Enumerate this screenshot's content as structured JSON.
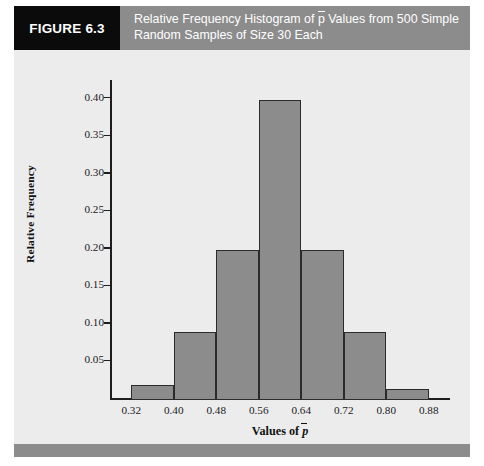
{
  "figure": {
    "tag": "FIGURE 6.3",
    "caption_line1_pre": "Relative Frequency Histogram of ",
    "caption_pbar": "p",
    "caption_line1_post": " Values from 500 Simple",
    "caption_line2": "Random Samples of Size 30 Each",
    "header_bg": "#8c8c8c",
    "tag_bg": "#0b0b0b",
    "panel_bg": "#ececed"
  },
  "chart_data": {
    "type": "bar",
    "xlabel": "Values of p̄",
    "ylabel": "Relative Frequency",
    "grid": false,
    "legend": "none",
    "bar_color": "#8c8c8c",
    "bar_edge_color": "#2b2b2b",
    "xlim": [
      0.28,
      0.92
    ],
    "ylim": [
      0.0,
      0.425
    ],
    "xticks": [
      "0.32",
      "0.40",
      "0.48",
      "0.56",
      "0.64",
      "0.72",
      "0.80",
      "0.88"
    ],
    "xtick_values": [
      0.32,
      0.4,
      0.48,
      0.56,
      0.64,
      0.72,
      0.8,
      0.88
    ],
    "yticks": [
      "0.05",
      "0.10",
      "0.15",
      "0.20",
      "0.25",
      "0.30",
      "0.35",
      "0.40"
    ],
    "ytick_values": [
      0.05,
      0.1,
      0.15,
      0.2,
      0.25,
      0.3,
      0.35,
      0.4
    ],
    "bin_width": 0.08,
    "bins": [
      {
        "label": "0.32-0.40",
        "left": 0.32,
        "right": 0.4,
        "value": 0.02
      },
      {
        "label": "0.40-0.48",
        "left": 0.4,
        "right": 0.48,
        "value": 0.09
      },
      {
        "label": "0.48-0.56",
        "left": 0.48,
        "right": 0.56,
        "value": 0.2
      },
      {
        "label": "0.56-0.64",
        "left": 0.56,
        "right": 0.64,
        "value": 0.4
      },
      {
        "label": "0.64-0.72",
        "left": 0.64,
        "right": 0.72,
        "value": 0.2
      },
      {
        "label": "0.72-0.80",
        "left": 0.72,
        "right": 0.8,
        "value": 0.09
      },
      {
        "label": "0.80-0.88",
        "left": 0.8,
        "right": 0.88,
        "value": 0.015
      }
    ],
    "categories": [
      "0.32-0.40",
      "0.40-0.48",
      "0.48-0.56",
      "0.56-0.64",
      "0.64-0.72",
      "0.72-0.80",
      "0.80-0.88"
    ],
    "values": [
      0.02,
      0.09,
      0.2,
      0.4,
      0.2,
      0.09,
      0.015
    ]
  }
}
